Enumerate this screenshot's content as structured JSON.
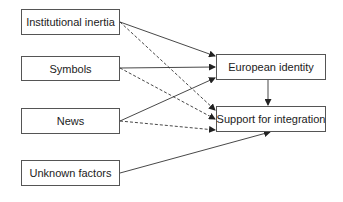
{
  "diagram": {
    "type": "path-diagram",
    "nodes": [
      {
        "id": "institutional_inertia",
        "label": "Institutional inertia"
      },
      {
        "id": "symbols",
        "label": "Symbols"
      },
      {
        "id": "news",
        "label": "News"
      },
      {
        "id": "unknown_factors",
        "label": "Unknown factors"
      },
      {
        "id": "european_identity",
        "label": "European identity"
      },
      {
        "id": "support_for_integration",
        "label": "Support for integration"
      }
    ],
    "edges": [
      {
        "from": "institutional_inertia",
        "to": "european_identity",
        "style": "solid"
      },
      {
        "from": "institutional_inertia",
        "to": "support_for_integration",
        "style": "dashed"
      },
      {
        "from": "symbols",
        "to": "european_identity",
        "style": "solid"
      },
      {
        "from": "symbols",
        "to": "support_for_integration",
        "style": "dashed"
      },
      {
        "from": "news",
        "to": "european_identity",
        "style": "solid"
      },
      {
        "from": "news",
        "to": "support_for_integration",
        "style": "dashed"
      },
      {
        "from": "unknown_factors",
        "to": "support_for_integration",
        "style": "solid"
      },
      {
        "from": "european_identity",
        "to": "support_for_integration",
        "style": "solid"
      }
    ],
    "colors": {
      "line": "#333333",
      "border": "#555555",
      "text": "#222222"
    }
  }
}
